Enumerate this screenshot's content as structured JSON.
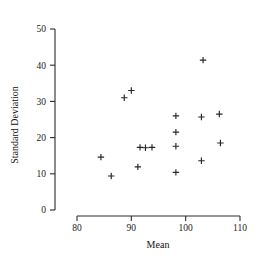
{
  "chart_data": {
    "type": "scatter",
    "title": "",
    "xlabel": "Mean",
    "ylabel": "Standard Deviation",
    "xlim": [
      80,
      110
    ],
    "ylim": [
      0,
      50
    ],
    "xticks": [
      80,
      90,
      100,
      110
    ],
    "yticks": [
      0,
      10,
      20,
      30,
      40,
      50
    ],
    "xtick_labels": [
      "80",
      "90",
      "100",
      "110"
    ],
    "ytick_labels": [
      "0",
      "10",
      "20",
      "30",
      "40",
      "50"
    ],
    "grid": false,
    "legend": null,
    "marker": "plus",
    "marker_color": "#262626",
    "n_points": 17,
    "points": [
      {
        "x": 84.4,
        "y": 14.6
      },
      {
        "x": 86.3,
        "y": 9.4
      },
      {
        "x": 88.7,
        "y": 31.0
      },
      {
        "x": 90.0,
        "y": 33.0
      },
      {
        "x": 91.2,
        "y": 11.9
      },
      {
        "x": 91.6,
        "y": 17.3
      },
      {
        "x": 93.8,
        "y": 17.3
      },
      {
        "x": 98.2,
        "y": 26.0
      },
      {
        "x": 98.2,
        "y": 21.5
      },
      {
        "x": 98.2,
        "y": 17.6
      },
      {
        "x": 98.2,
        "y": 10.4
      },
      {
        "x": 102.9,
        "y": 25.7
      },
      {
        "x": 102.9,
        "y": 13.6
      },
      {
        "x": 103.2,
        "y": 41.4
      },
      {
        "x": 106.2,
        "y": 26.5
      },
      {
        "x": 106.4,
        "y": 18.5
      },
      {
        "x": 92.6,
        "y": 17.2
      }
    ],
    "x": [
      84.4,
      86.3,
      88.7,
      90.0,
      91.2,
      91.6,
      92.6,
      93.8,
      98.2,
      98.2,
      98.2,
      98.2,
      102.9,
      102.9,
      103.2,
      106.2,
      106.4
    ],
    "y": [
      14.6,
      9.4,
      31.0,
      33.0,
      11.9,
      17.3,
      17.2,
      17.3,
      26.0,
      21.5,
      17.6,
      10.4,
      25.7,
      13.6,
      41.4,
      26.5,
      18.5
    ]
  },
  "axes": {
    "y_axis_name": "y-axis",
    "x_axis_name": "x-axis"
  }
}
